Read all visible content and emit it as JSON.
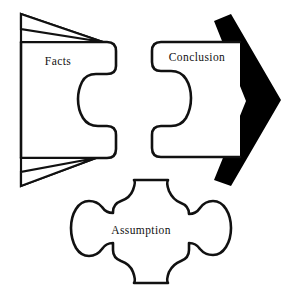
{
  "diagram": {
    "background_color": "#ffffff",
    "line_color": "#111111",
    "fill_color": "#ffffff",
    "arrow_color": "#000000",
    "pieces": [
      {
        "id": "facts",
        "label": "Facts",
        "icon_name": "puzzle-piece-socket-right",
        "label_x": 58,
        "label_y": 62
      },
      {
        "id": "conclusion",
        "label": "Conclusion",
        "icon_name": "puzzle-piece-tab-left",
        "label_x": 197,
        "label_y": 58
      },
      {
        "id": "assumption",
        "label": "Assumption",
        "icon_name": "puzzle-piece-cross",
        "label_x": 141,
        "label_y": 231
      }
    ],
    "arrow": {
      "id": "conclusion-arrow",
      "icon_name": "right-arrow-chevron",
      "color": "#000000"
    },
    "flag_marks": {
      "id": "facts-flag-marks",
      "icon_name": "triangle-flag-marks",
      "count": 2,
      "positions": [
        "top-left",
        "bottom-left"
      ]
    }
  }
}
